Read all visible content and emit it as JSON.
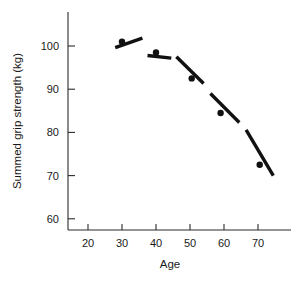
{
  "chart_data": {
    "type": "scatter",
    "title": "",
    "xlabel": "Age",
    "ylabel": "Summed grip strength (kg)",
    "xlim": [
      16,
      78
    ],
    "ylim": [
      57,
      106
    ],
    "xticks": [
      20,
      30,
      40,
      50,
      60,
      70
    ],
    "yticks": [
      60,
      70,
      80,
      90,
      100
    ],
    "grid": false,
    "legend": null,
    "x": [
      30,
      40,
      50.5,
      59,
      70.5
    ],
    "y": [
      101,
      98.5,
      92.5,
      84.5,
      72.5
    ],
    "points": [
      {
        "age": 30,
        "strength": 101
      },
      {
        "age": 40,
        "strength": 98.5
      },
      {
        "age": 50.5,
        "strength": 92.5
      },
      {
        "age": 59,
        "strength": 84.5
      },
      {
        "age": 70.5,
        "strength": 72.5
      }
    ],
    "trend_segments": [
      {
        "x1": 28.0,
        "y1": 99.6,
        "x2": 36.0,
        "y2": 101.8
      },
      {
        "x1": 37.5,
        "y1": 97.8,
        "x2": 44.5,
        "y2": 97.2
      },
      {
        "x1": 46.0,
        "y1": 97.5,
        "x2": 54.0,
        "y2": 91.3
      },
      {
        "x1": 56.0,
        "y1": 89.0,
        "x2": 64.5,
        "y2": 82.3
      },
      {
        "x1": 66.5,
        "y1": 80.6,
        "x2": 74.5,
        "y2": 70.0
      }
    ]
  },
  "axes": {
    "x_title": "Age",
    "y_title": "Summed grip strength (kg)",
    "x_tick_labels": [
      "20",
      "30",
      "40",
      "50",
      "60",
      "70"
    ],
    "y_tick_labels": [
      "100",
      "90",
      "80",
      "70",
      "60"
    ]
  },
  "colors": {
    "background": "#ffffff",
    "axis": "#2b2b2b",
    "marker": "#111111",
    "trend": "#111111",
    "text": "#1a1a1a"
  }
}
